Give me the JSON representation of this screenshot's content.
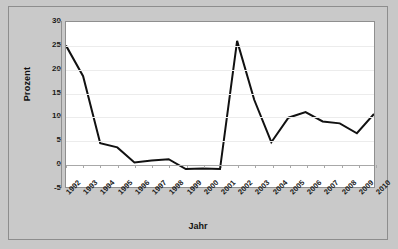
{
  "chart_data": {
    "type": "line",
    "title": "",
    "xlabel": "Jahr",
    "ylabel": "Prozent",
    "ylim": [
      -5,
      30
    ],
    "yticks": [
      30,
      25,
      20,
      15,
      10,
      5,
      0,
      -5
    ],
    "grid": true,
    "legend": null,
    "line_color": "#111111",
    "categories": [
      "1992",
      "1993",
      "1994",
      "1995",
      "1996",
      "1997",
      "1998",
      "1999",
      "2000",
      "2001",
      "2002",
      "2003",
      "2004",
      "2005",
      "2006",
      "2007",
      "2008",
      "2009",
      "2010"
    ],
    "values": [
      25.0,
      18.5,
      4.3,
      3.4,
      0.2,
      0.6,
      0.9,
      -1.2,
      -1.1,
      -1.2,
      26.0,
      13.5,
      4.5,
      9.7,
      10.9,
      8.9,
      8.5,
      6.4,
      10.5
    ],
    "series": [
      {
        "name": "Prozent",
        "values": [
          25.0,
          18.5,
          4.3,
          3.4,
          0.2,
          0.6,
          0.9,
          -1.2,
          -1.1,
          -1.2,
          26.0,
          13.5,
          4.5,
          9.7,
          10.9,
          8.9,
          8.5,
          6.4,
          10.5
        ]
      }
    ]
  }
}
